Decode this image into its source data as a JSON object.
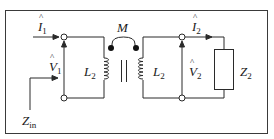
{
  "diagram": {
    "type": "coupled-inductor circuit",
    "colors": {
      "line": "#2a2a2a",
      "background": "#ffffff",
      "border": "#3a3a3a"
    },
    "labels": {
      "i1": {
        "main": "I",
        "sub": "1"
      },
      "i2": {
        "main": "I",
        "sub": "2"
      },
      "v1": {
        "main": "V",
        "sub": "1"
      },
      "v2": {
        "main": "V",
        "sub": "2"
      },
      "m": "M",
      "l_left": {
        "main": "L",
        "sub": "2"
      },
      "l_right": {
        "main": "L",
        "sub": "2"
      },
      "z2": {
        "main": "Z",
        "sub": "2"
      },
      "zin": {
        "main": "Z",
        "sub": "in"
      }
    }
  }
}
